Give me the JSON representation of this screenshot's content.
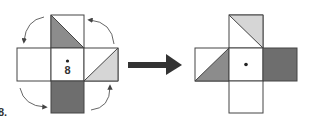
{
  "problem_number": "8.",
  "center_label": "8",
  "colors": {
    "dark": "#6e6e6e",
    "medium": "#8c8c8c",
    "light": "#d6d6d6",
    "stroke": "#444444",
    "arrow": "#333333"
  },
  "left_net": {
    "faces": {
      "top": "triangle-lower-left-medium",
      "left": "blank",
      "center": "dot-with-label",
      "right": "triangle-lower-right-light",
      "bottom": "solid-dark"
    },
    "rotation_arrows": [
      "top-left",
      "top-right",
      "bottom-left",
      "bottom-right"
    ]
  },
  "right_net": {
    "faces": {
      "top": "triangle-upper-right-light",
      "left": "triangle-lower-right-medium",
      "center": "dot",
      "right": "solid-dark",
      "bottom": "blank"
    }
  }
}
